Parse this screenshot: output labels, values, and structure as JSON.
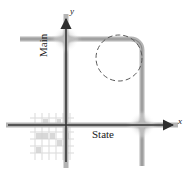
{
  "figure": {
    "background_color": "#ffffff"
  },
  "axes": {
    "x_axis": {
      "label": "x",
      "name": "x-axis",
      "color": "#3a3a3a",
      "y_position": 125,
      "x_start": 8,
      "x_end": 176,
      "arrow": "right"
    },
    "y_axis": {
      "label": "y",
      "name": "y-axis",
      "color": "#3a3a3a",
      "x_position": 66,
      "y_start": 162,
      "y_end": 16,
      "arrow": "up"
    }
  },
  "streets": [
    {
      "name": "Main",
      "label": "Main",
      "orientation": "vertical",
      "color": "#b0b0b0",
      "center_color": "#8a8a8a"
    },
    {
      "name": "State",
      "label": "State",
      "orientation": "horizontal",
      "color": "#b0b0b0",
      "center_color": "#8a8a8a"
    },
    {
      "name": "north-road",
      "label": "",
      "orientation": "horizontal",
      "color": "#b0b0b0",
      "center_color": "#8a8a8a"
    },
    {
      "name": "east-road",
      "label": "",
      "orientation": "vertical",
      "color": "#b0b0b0",
      "center_color": "#8a8a8a"
    }
  ],
  "curve": {
    "name": "road-corner-curve",
    "description": "quarter-circle corner joining north road to east road",
    "color": "#9a9a9a"
  },
  "circle": {
    "name": "dashed-circle",
    "style": "dashed",
    "center_x": 119,
    "center_y": 58,
    "radius": 23,
    "color": "#555555"
  },
  "intersections": [
    {
      "name": "intersection-main-north",
      "x": 66,
      "y": 39,
      "color": "#b8b8b8"
    },
    {
      "name": "intersection-east-state",
      "x": 141,
      "y": 125,
      "color": "#b8b8b8"
    }
  ],
  "city_grid": {
    "name": "city-block-grid",
    "description": "faint grid of city blocks in lower-left quadrant",
    "color": "#d8d8d8"
  }
}
